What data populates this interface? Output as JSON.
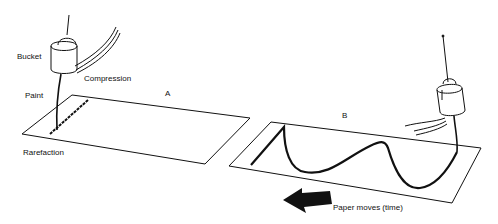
{
  "diagram": {
    "panel_a": {
      "label": "A",
      "bucket_label": "Bucket",
      "paint_label": "Paint",
      "compression_label": "Compression",
      "rarefaction_label": "Rarefaction"
    },
    "panel_b": {
      "label": "B",
      "arrow_label": "Paper moves (time)"
    },
    "colors": {
      "ink": "#111111",
      "paper": "#ffffff"
    }
  }
}
